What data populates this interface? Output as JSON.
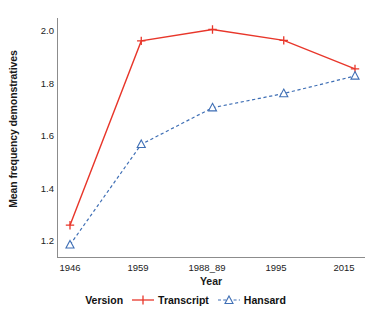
{
  "chart_data": {
    "type": "line",
    "title": "",
    "xlabel": "Year",
    "ylabel": "Mean frequency demonstratives",
    "categories": [
      "1946",
      "1959",
      "1988_89",
      "1995",
      "2015"
    ],
    "yticks": [
      1.2,
      1.4,
      1.6,
      1.8,
      2.0
    ],
    "ytick_labels": [
      "1.2",
      "1.4",
      "1.6",
      "1.8",
      "2.0"
    ],
    "ylim": [
      1.12,
      2.06
    ],
    "grid": false,
    "legend_position": "bottom",
    "legend_title": "Version",
    "series": [
      {
        "name": "Transcript",
        "values": [
          1.245,
          1.97,
          2.015,
          1.972,
          1.86
        ],
        "color": "#e8362a",
        "linestyle": "solid",
        "marker": "plus"
      },
      {
        "name": "Hansard",
        "values": [
          1.168,
          1.563,
          1.707,
          1.763,
          1.832
        ],
        "color": "#3f6fb5",
        "linestyle": "dashed",
        "marker": "triangle-up"
      }
    ]
  },
  "axes": {
    "frame_color": "#8c8c8c"
  }
}
